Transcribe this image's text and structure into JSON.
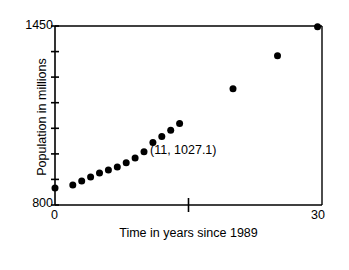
{
  "figure": {
    "background_color": "#ffffff",
    "ink_color": "#000000"
  },
  "axes": {
    "y_top_label": "1450",
    "y_bottom_label": "800",
    "x_left_label": "0",
    "x_right_label": "30",
    "y_title": "Population in millions",
    "x_title": "Time in years since 1989"
  },
  "annotation": {
    "text": "(11, 1027.1)"
  },
  "chart_data": {
    "type": "scatter",
    "title": "",
    "xlabel": "Time in years since 1989",
    "ylabel": "Population in millions",
    "xlim": [
      0,
      30
    ],
    "ylim": [
      800,
      1450
    ],
    "xticks": [
      0,
      15,
      30
    ],
    "xtick_labels": [
      "0",
      "",
      "30"
    ],
    "yticks": [
      800,
      893,
      986,
      1079,
      1171,
      1264,
      1357,
      1450
    ],
    "ytick_labels": [
      "800",
      "",
      "",
      "",
      "",
      "",
      "",
      "1450"
    ],
    "grid": false,
    "legend": null,
    "marker": {
      "shape": "circle",
      "color": "#000000",
      "size_px": 7
    },
    "annotations": [
      {
        "text": "(11, 1027.1)",
        "x": 11,
        "y": 1027.1,
        "label_x": 12.0,
        "label_y": 1020.0
      }
    ],
    "series": [
      {
        "name": "Population",
        "points": [
          {
            "x": 0,
            "y": 862
          },
          {
            "x": 2,
            "y": 873
          },
          {
            "x": 3,
            "y": 887
          },
          {
            "x": 4,
            "y": 902
          },
          {
            "x": 5,
            "y": 916
          },
          {
            "x": 6,
            "y": 927
          },
          {
            "x": 7,
            "y": 938
          },
          {
            "x": 8,
            "y": 953
          },
          {
            "x": 9,
            "y": 971
          },
          {
            "x": 10,
            "y": 993
          },
          {
            "x": 11,
            "y": 1027.1
          },
          {
            "x": 12,
            "y": 1049
          },
          {
            "x": 13,
            "y": 1071
          },
          {
            "x": 14,
            "y": 1096
          },
          {
            "x": 20,
            "y": 1222
          },
          {
            "x": 25,
            "y": 1342
          },
          {
            "x": 29.5,
            "y": 1447
          }
        ]
      }
    ]
  }
}
